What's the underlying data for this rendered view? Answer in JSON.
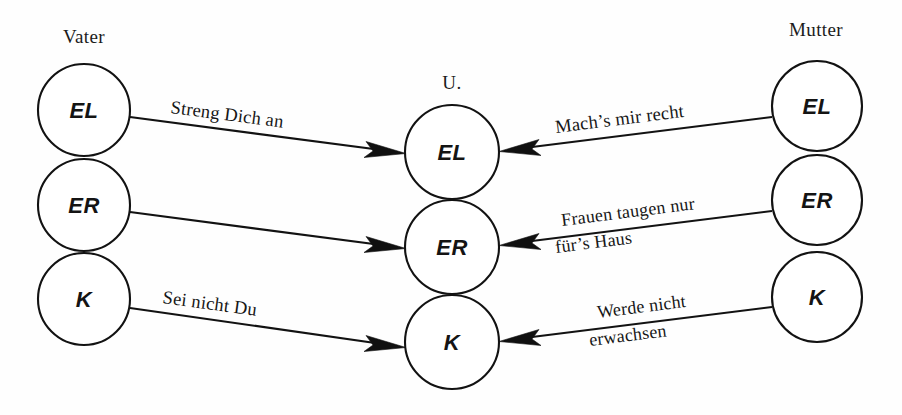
{
  "diagram": {
    "background_color": "#fefefe",
    "ink_color": "#121212",
    "columns": {
      "left_heading": "Vater",
      "center_heading": "U.",
      "right_heading": "Mutter"
    },
    "nodes": {
      "left": [
        {
          "id": "vater-el",
          "label": "EL"
        },
        {
          "id": "vater-er",
          "label": "ER"
        },
        {
          "id": "vater-k",
          "label": "K"
        }
      ],
      "center": [
        {
          "id": "u-el",
          "label": "EL"
        },
        {
          "id": "u-er",
          "label": "ER"
        },
        {
          "id": "u-k",
          "label": "K"
        }
      ],
      "right": [
        {
          "id": "mutter-el",
          "label": "EL"
        },
        {
          "id": "mutter-er",
          "label": "ER"
        },
        {
          "id": "mutter-k",
          "label": "K"
        }
      ]
    },
    "edges": [
      {
        "id": "edge-vater-el",
        "from": "vater-el",
        "to": "u-el",
        "direction": "left-to-right",
        "label_lines": [
          "Streng Dich an"
        ]
      },
      {
        "id": "edge-vater-er",
        "from": "vater-er",
        "to": "u-er",
        "direction": "left-to-right",
        "label_lines": []
      },
      {
        "id": "edge-vater-k",
        "from": "vater-k",
        "to": "u-k",
        "direction": "left-to-right",
        "label_lines": [
          "Sei nicht Du"
        ]
      },
      {
        "id": "edge-mutter-el",
        "from": "mutter-el",
        "to": "u-el",
        "direction": "right-to-left",
        "label_lines": [
          "Mach’s mir recht"
        ]
      },
      {
        "id": "edge-mutter-er",
        "from": "mutter-er",
        "to": "u-er",
        "direction": "right-to-left",
        "label_lines": [
          "Frauen taugen nur",
          "für’s Haus"
        ]
      },
      {
        "id": "edge-mutter-k",
        "from": "mutter-k",
        "to": "u-k",
        "direction": "right-to-left",
        "label_lines": [
          "Werde nicht",
          "erwachsen"
        ]
      }
    ]
  }
}
